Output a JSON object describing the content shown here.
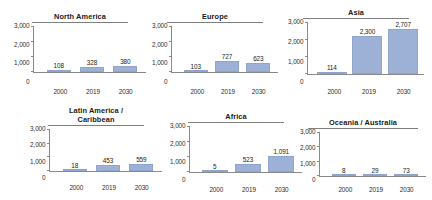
{
  "figure": {
    "background": "#ffffff",
    "bar_color": "#9db1d6",
    "axis_color": "#8a8a8a",
    "text_color": "#1a1a1a"
  },
  "chart_data": [
    {
      "type": "bar",
      "title": "North America",
      "categories": [
        "2000",
        "2019",
        "2030"
      ],
      "values": [
        108,
        328,
        380
      ],
      "value_labels": [
        "108",
        "328",
        "380"
      ],
      "xlabel": "",
      "ylabel": "",
      "ylim": [
        0,
        3000
      ],
      "yticks": [
        3000,
        2000,
        1000,
        0
      ],
      "ytick_labels": [
        "3,000",
        "2,000",
        "1,000",
        "0"
      ],
      "grid": false,
      "legend": "none"
    },
    {
      "type": "bar",
      "title": "Europe",
      "categories": [
        "2000",
        "2019",
        "2030"
      ],
      "values": [
        103,
        727,
        623
      ],
      "value_labels": [
        "103",
        "727",
        "623"
      ],
      "xlabel": "",
      "ylabel": "",
      "ylim": [
        0,
        3000
      ],
      "yticks": [
        3000,
        2000,
        1000,
        0
      ],
      "ytick_labels": [
        "3,000",
        "2,000",
        "1,000",
        "0"
      ],
      "grid": false,
      "legend": "none"
    },
    {
      "type": "bar",
      "title": "Asia",
      "categories": [
        "2000",
        "2019",
        "2030"
      ],
      "values": [
        114,
        2300,
        2707
      ],
      "value_labels": [
        "114",
        "2,300",
        "2,707"
      ],
      "xlabel": "",
      "ylabel": "",
      "ylim": [
        0,
        3000
      ],
      "yticks": [
        3000,
        2000,
        1000,
        0
      ],
      "ytick_labels": [
        "3,000",
        "2,000",
        "1,000",
        "0"
      ],
      "grid": false,
      "legend": "none"
    },
    {
      "type": "bar",
      "title": "Latin America /\nCaribbean",
      "categories": [
        "2000",
        "2019",
        "2030"
      ],
      "values": [
        18,
        453,
        559
      ],
      "value_labels": [
        "18",
        "453",
        "559"
      ],
      "xlabel": "",
      "ylabel": "",
      "ylim": [
        0,
        3000
      ],
      "yticks": [
        3000,
        2000,
        1000,
        0
      ],
      "ytick_labels": [
        "3,000",
        "2,000",
        "1,000",
        "0"
      ],
      "grid": false,
      "legend": "none"
    },
    {
      "type": "bar",
      "title": "Africa",
      "categories": [
        "2000",
        "2019",
        "2030"
      ],
      "values": [
        5,
        523,
        1091
      ],
      "value_labels": [
        "5",
        "523",
        "1,091"
      ],
      "xlabel": "",
      "ylabel": "",
      "ylim": [
        0,
        3000
      ],
      "yticks": [
        3000,
        2000,
        1000,
        0
      ],
      "ytick_labels": [
        "3,000",
        "2,000",
        "1,000",
        "0"
      ],
      "grid": false,
      "legend": "none"
    },
    {
      "type": "bar",
      "title": "Oceania / Australia",
      "categories": [
        "2000",
        "2019",
        "2030"
      ],
      "values": [
        8,
        29,
        73
      ],
      "value_labels": [
        "8",
        "29",
        "73"
      ],
      "xlabel": "",
      "ylabel": "",
      "ylim": [
        0,
        3000
      ],
      "yticks": [
        3000,
        2000,
        1000,
        0
      ],
      "ytick_labels": [
        "3,000",
        "2,000",
        "1,000",
        "0"
      ],
      "grid": false,
      "legend": "none"
    }
  ],
  "layout": [
    {
      "left": 14,
      "top": 12,
      "width": 132,
      "height": 84,
      "title_rule_width": 96,
      "plot_height": 46,
      "bar_width": 24,
      "bars_inset": 8
    },
    {
      "left": 152,
      "top": 12,
      "width": 126,
      "height": 84,
      "title_rule_width": 96,
      "plot_height": 46,
      "bar_width": 24,
      "bars_inset": 8
    },
    {
      "left": 288,
      "top": 8,
      "width": 136,
      "height": 88,
      "title_rule_width": 106,
      "plot_height": 52,
      "bar_width": 30,
      "bars_inset": 6
    },
    {
      "left": 30,
      "top": 106,
      "width": 132,
      "height": 86,
      "title_rule_width": 96,
      "plot_height": 42,
      "bar_width": 24,
      "bars_inset": 8
    },
    {
      "left": 170,
      "top": 112,
      "width": 132,
      "height": 82,
      "title_rule_width": 96,
      "plot_height": 46,
      "bar_width": 26,
      "bars_inset": 8
    },
    {
      "left": 300,
      "top": 118,
      "width": 126,
      "height": 76,
      "title_rule_width": 110,
      "plot_height": 44,
      "bar_width": 24,
      "bars_inset": 8
    }
  ]
}
